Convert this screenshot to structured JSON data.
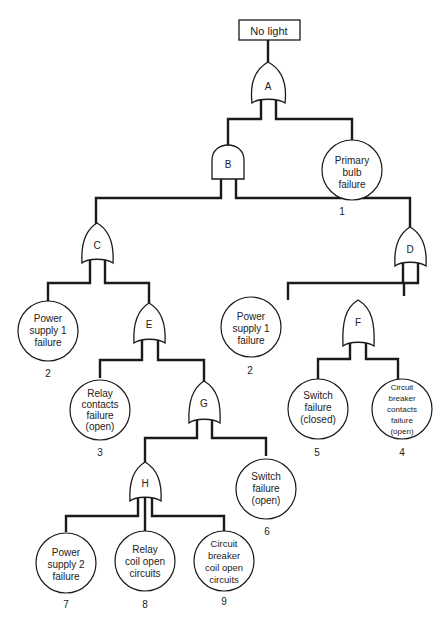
{
  "top_event": {
    "label": "No light"
  },
  "gates": {
    "A": {
      "label": "A",
      "type": "OR"
    },
    "B": {
      "label": "B",
      "type": "AND"
    },
    "C": {
      "label": "C",
      "type": "OR"
    },
    "D": {
      "label": "D",
      "type": "OR"
    },
    "E": {
      "label": "E",
      "type": "OR"
    },
    "F": {
      "label": "F",
      "type": "OR"
    },
    "G": {
      "label": "G",
      "type": "OR"
    },
    "H": {
      "label": "H",
      "type": "OR"
    }
  },
  "events": {
    "primary_bulb": {
      "lines": [
        "Primary",
        "bulb",
        "failure"
      ],
      "number": "1"
    },
    "power_supply_1_c": {
      "lines": [
        "Power",
        "supply 1",
        "failure"
      ],
      "number": "2"
    },
    "power_supply_1_d": {
      "lines": [
        "Power",
        "supply 1",
        "failure"
      ],
      "number": "2"
    },
    "relay_contacts": {
      "lines": [
        "Relay",
        "contacts",
        "failure",
        "(open)"
      ],
      "number": "3"
    },
    "switch_closed": {
      "lines": [
        "Switch",
        "failure",
        "(closed)"
      ],
      "number": "5"
    },
    "cb_contacts": {
      "lines": [
        "Circuit",
        "breaker",
        "contacts",
        "failure",
        "(open)"
      ],
      "number": "4"
    },
    "switch_open": {
      "lines": [
        "Switch",
        "failure",
        "(open)"
      ],
      "number": "6"
    },
    "power_supply_2": {
      "lines": [
        "Power",
        "supply 2",
        "failure"
      ],
      "number": "7"
    },
    "relay_coil": {
      "lines": [
        "Relay",
        "coil open",
        "circuits"
      ],
      "number": "8"
    },
    "cb_coil": {
      "lines": [
        "Circuit",
        "breaker",
        "coil open",
        "circuits"
      ],
      "number": "9"
    }
  }
}
